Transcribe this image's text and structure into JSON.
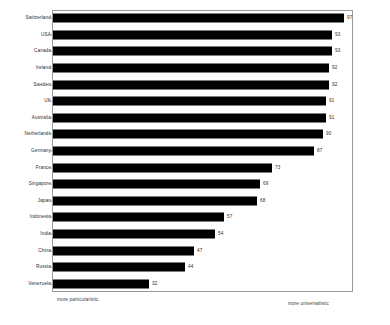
{
  "chart_data": {
    "type": "bar",
    "orientation": "horizontal",
    "title": "",
    "subtitle": "",
    "xlabel": "",
    "ylabel": "",
    "xlim": [
      0,
      100
    ],
    "grid": false,
    "legend": null,
    "bar_color": "#000000",
    "frame_color": "#9a9a9a",
    "categories": [
      "Switzerland",
      "USA",
      "Canada",
      "Ireland",
      "Sweden",
      "UK",
      "Australia",
      "Netherlands",
      "Germany",
      "France",
      "Singapore",
      "Japan",
      "Indonesia",
      "India",
      "China",
      "Russia",
      "Venezuela"
    ],
    "values": [
      97,
      93,
      93,
      92,
      92,
      91,
      91,
      90,
      87,
      73,
      69,
      68,
      57,
      54,
      47,
      44,
      32
    ],
    "value_labels": [
      "97",
      "93",
      "93",
      "92",
      "92",
      "91",
      "91",
      "90",
      "87",
      "73",
      "69",
      "68",
      "57",
      "54",
      "47",
      "44",
      "32"
    ],
    "annotations": {
      "axis_left": "more particularistic",
      "axis_right": "more universalistic"
    }
  }
}
